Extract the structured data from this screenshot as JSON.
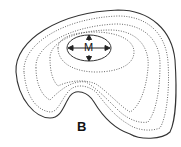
{
  "diagram": {
    "center_label": "M",
    "figure_label": "B",
    "colors": {
      "outline": "#333333",
      "contours": "#555555",
      "background": "#ffffff"
    },
    "contour_count": 4,
    "arrows": [
      "up",
      "down",
      "left",
      "right"
    ]
  }
}
